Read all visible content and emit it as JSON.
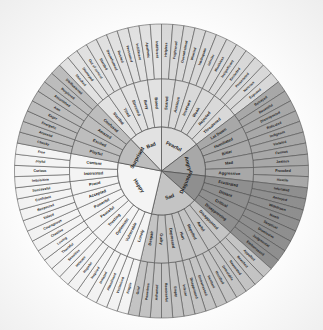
{
  "geometry": {
    "cx": 161.5,
    "cy": 171.0,
    "r_core": 44.0,
    "r_mid": 92.0,
    "r_out": 147.0,
    "start_angle_deg": -90.0
  },
  "palette": {
    "fearful": "#d9d9d9",
    "angry": "#a8a8a8",
    "disgusted": "#8f8f8f",
    "sad": "#c4c4c4",
    "happy": "#f4f4f4",
    "surprised": "#bdbdbd",
    "bad": "#e2e2e2",
    "stroke": "#4a4a4a",
    "text": "#1b1b1b",
    "background": "#ffffff"
  },
  "chart_data": {
    "type": "pie",
    "rings": [
      "core",
      "secondary",
      "tertiary"
    ],
    "core_labels": [
      "Fearful",
      "Angry",
      "Disgusted",
      "Sad",
      "Happy",
      "Surprised",
      "Bad"
    ],
    "core_values": [
      6,
      5,
      4,
      7,
      10,
      4,
      4
    ],
    "secondary_counts": [
      6,
      5,
      4,
      7,
      10,
      4,
      4
    ],
    "tertiary_counts": [
      12,
      10,
      8,
      14,
      20,
      8,
      8
    ],
    "total_secondary": 40,
    "total_tertiary": 80
  },
  "wheel": {
    "sectors": [
      {
        "core": "Fearful",
        "color_key": "fearful",
        "secondary": [
          {
            "label": "Scared",
            "tertiary": [
              "Helpless",
              "Frightened"
            ]
          },
          {
            "label": "Anxious",
            "tertiary": [
              "Overwhelmed",
              "Worried"
            ]
          },
          {
            "label": "Insecure",
            "tertiary": [
              "Inadequate",
              "Inferior"
            ]
          },
          {
            "label": "Weak",
            "tertiary": [
              "Worthless",
              "Insignificant"
            ]
          },
          {
            "label": "Rejected",
            "tertiary": [
              "Excluded",
              "Persecuted"
            ]
          },
          {
            "label": "Threatened",
            "tertiary": [
              "Nervous",
              "Exposed"
            ]
          }
        ]
      },
      {
        "core": "Angry",
        "color_key": "angry",
        "secondary": [
          {
            "label": "Let Down",
            "tertiary": [
              "Betrayed",
              "Resentful"
            ]
          },
          {
            "label": "Humiliated",
            "tertiary": [
              "Disrespected",
              "Ridiculed"
            ]
          },
          {
            "label": "Bitter",
            "tertiary": [
              "Indignant",
              "Violated"
            ]
          },
          {
            "label": "Mad",
            "tertiary": [
              "Furious",
              "Jealous"
            ]
          },
          {
            "label": "Aggressive",
            "tertiary": [
              "Provoked",
              "Hostile"
            ]
          }
        ]
      },
      {
        "core": "Disgusted",
        "color_key": "disgusted",
        "secondary": [
          {
            "label": "Frustrated",
            "tertiary": [
              "Infuriated",
              "Annoyed"
            ]
          },
          {
            "label": "Distant",
            "tertiary": [
              "Withdrawn",
              "Numb"
            ]
          },
          {
            "label": "Critical",
            "tertiary": [
              "Skeptical",
              "Dismissive"
            ]
          },
          {
            "label": "Disapproving",
            "tertiary": [
              "Judgmental",
              "Embarrassed"
            ]
          }
        ]
      },
      {
        "core": "Sad",
        "color_key": "sad",
        "secondary": [
          {
            "label": "Disappointed",
            "tertiary": [
              "Appalled",
              "Revolted"
            ]
          },
          {
            "label": "Awful",
            "tertiary": [
              "Nauseated",
              "Detestable"
            ]
          },
          {
            "label": "Repelled",
            "tertiary": [
              "Horrified",
              "Hesitant"
            ]
          },
          {
            "label": "Hurt",
            "tertiary": [
              "Embarrassed",
              "Disappointed"
            ]
          },
          {
            "label": "Depressed",
            "tertiary": [
              "Inferior",
              "Empty"
            ]
          },
          {
            "label": "Guilty",
            "tertiary": [
              "Remorseful",
              "Ashamed"
            ]
          },
          {
            "label": "Despair",
            "tertiary": [
              "Powerless",
              "Grief"
            ]
          }
        ]
      },
      {
        "core": "Happy",
        "color_key": "happy",
        "secondary": [
          {
            "label": "Lonely",
            "tertiary": [
              "Fragile",
              "Victimised"
            ]
          },
          {
            "label": "Vulnerable",
            "tertiary": [
              "Abandoned",
              "Isolated"
            ]
          },
          {
            "label": "Optimistic",
            "tertiary": [
              "Inspired",
              "Hopeful"
            ]
          },
          {
            "label": "Trusting",
            "tertiary": [
              "Intimate",
              "Sensitive"
            ]
          },
          {
            "label": "Peaceful",
            "tertiary": [
              "Thankful",
              "Loving"
            ]
          },
          {
            "label": "Powerful",
            "tertiary": [
              "Creative",
              "Courageous"
            ]
          },
          {
            "label": "Accepted",
            "tertiary": [
              "Valued",
              "Respected"
            ]
          },
          {
            "label": "Proud",
            "tertiary": [
              "Confident",
              "Successful"
            ]
          },
          {
            "label": "Interested",
            "tertiary": [
              "Inquisitive",
              "Curious"
            ]
          },
          {
            "label": "Content",
            "tertiary": [
              "Joyful",
              "Free"
            ]
          }
        ]
      },
      {
        "core": "Surprised",
        "color_key": "surprised",
        "secondary": [
          {
            "label": "Playful",
            "tertiary": [
              "Cheeky",
              "Aroused"
            ]
          },
          {
            "label": "Excited",
            "tertiary": [
              "Energetic",
              "Eager"
            ]
          },
          {
            "label": "Amazed",
            "tertiary": [
              "Awe",
              "Astonished"
            ]
          },
          {
            "label": "Confused",
            "tertiary": [
              "Perplexed",
              "Disillusioned"
            ]
          }
        ]
      },
      {
        "core": "Bad",
        "color_key": "bad",
        "secondary": [
          {
            "label": "Startled",
            "tertiary": [
              "Shocked",
              "Dismayed"
            ]
          },
          {
            "label": "Tired",
            "tertiary": [
              "Out of control",
              "Startled"
            ]
          },
          {
            "label": "Stressed",
            "tertiary": [
              "Overwhelmed",
              "Rushed"
            ]
          },
          {
            "label": "Busy",
            "tertiary": [
              "Pressured",
              "Indifferent"
            ]
          },
          {
            "label": "Bored",
            "tertiary": [
              "Apathetic",
              "Indifferent"
            ]
          }
        ]
      }
    ]
  }
}
